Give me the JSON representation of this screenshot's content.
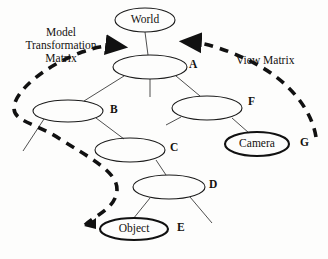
{
  "diagram": {
    "background_color": "#fdfdfc",
    "stroke_color": "#1a1a1a",
    "nodes": [
      {
        "id": "world",
        "label": "World",
        "tag": "",
        "bold": false,
        "cx": 145,
        "cy": 20,
        "rx": 30,
        "ry": 12
      },
      {
        "id": "a",
        "label": "",
        "tag": "A",
        "bold": false,
        "cx": 150,
        "cy": 67,
        "rx": 37,
        "ry": 12
      },
      {
        "id": "b",
        "label": "",
        "tag": "B",
        "bold": false,
        "cx": 68,
        "cy": 111,
        "rx": 35,
        "ry": 11
      },
      {
        "id": "f",
        "label": "",
        "tag": "F",
        "bold": false,
        "cx": 207,
        "cy": 108,
        "rx": 35,
        "ry": 12
      },
      {
        "id": "c",
        "label": "",
        "tag": "C",
        "bold": false,
        "cx": 130,
        "cy": 150,
        "rx": 35,
        "ry": 12
      },
      {
        "id": "camera",
        "label": "Camera",
        "tag": "G",
        "bold": true,
        "cx": 257,
        "cy": 144,
        "rx": 32,
        "ry": 12
      },
      {
        "id": "d",
        "label": "",
        "tag": "D",
        "bold": false,
        "cx": 169,
        "cy": 187,
        "rx": 36,
        "ry": 12
      },
      {
        "id": "object",
        "label": "Object",
        "tag": "E",
        "bold": true,
        "cx": 134,
        "cy": 229,
        "rx": 34,
        "ry": 11
      }
    ],
    "annotations": {
      "left": {
        "lines": [
          "Model",
          "Transformation",
          "Matrix"
        ],
        "x": 14,
        "y": 29
      },
      "right": {
        "text": "View Matrix",
        "x": 236,
        "y": 55
      }
    },
    "tags": {
      "a": {
        "text": "A",
        "x": 189,
        "y": 58
      },
      "b": {
        "text": "B",
        "x": 110,
        "y": 103
      },
      "f": {
        "text": "F",
        "x": 248,
        "y": 95
      },
      "c": {
        "text": "C",
        "x": 170,
        "y": 141
      },
      "g": {
        "text": "G",
        "x": 300,
        "y": 136
      },
      "d": {
        "text": "D",
        "x": 209,
        "y": 178
      },
      "e": {
        "text": "E",
        "x": 177,
        "y": 221
      }
    },
    "edges": [
      {
        "from": "world",
        "to": "a",
        "name": "edge-world-a"
      },
      {
        "from": "a",
        "to": "b",
        "name": "edge-a-b"
      },
      {
        "from": "a",
        "to": "f",
        "name": "edge-a-f"
      },
      {
        "from": "a",
        "to": "stub-down",
        "name": "edge-a-stub"
      },
      {
        "from": "b",
        "to": "c",
        "name": "edge-b-c"
      },
      {
        "from": "b",
        "to": "stub-left",
        "name": "edge-b-stub"
      },
      {
        "from": "f",
        "to": "camera",
        "name": "edge-f-camera"
      },
      {
        "from": "f",
        "to": "stub-left",
        "name": "edge-f-stub"
      },
      {
        "from": "c",
        "to": "d",
        "name": "edge-c-d"
      },
      {
        "from": "d",
        "to": "object",
        "name": "edge-d-object"
      },
      {
        "from": "d",
        "to": "stub-right",
        "name": "edge-d-stub"
      }
    ],
    "dashed_paths": [
      {
        "name": "model-transformation-path",
        "label_ref": "left",
        "arrow_head_at": [
          116,
          46
        ],
        "arrow_tail_at": [
          85,
          225
        ]
      },
      {
        "name": "view-matrix-path",
        "label_ref": "right",
        "arrow_head_at": [
          191,
          42
        ],
        "arrow_tail_at": [
          316,
          137
        ]
      }
    ]
  }
}
